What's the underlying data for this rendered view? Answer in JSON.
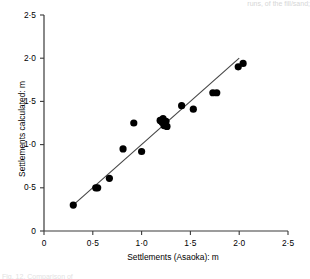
{
  "figure": {
    "clipped_header_text": "runs, of the fill/sand;",
    "clipped_caption_text": "Fig. 12.  Comparison of",
    "background_color": "#ffffff"
  },
  "chart_data": {
    "type": "scatter",
    "title": "",
    "xlabel": "Settlements (Asaoka): m",
    "ylabel": "Settlements calculated: m",
    "xlim": [
      0,
      2.5
    ],
    "ylim": [
      0,
      2.5
    ],
    "xticks": [
      0,
      0.5,
      1.0,
      1.5,
      2.0,
      2.5
    ],
    "yticks": [
      0,
      0.5,
      1.0,
      1.5,
      2.0,
      2.5
    ],
    "xtick_labels": [
      "0",
      "0·5",
      "1·0",
      "1·5",
      "2·0",
      "2·5"
    ],
    "ytick_labels": [
      "0",
      "0·5",
      "1·0",
      "1·5",
      "2·0",
      "2·5"
    ],
    "grid": false,
    "legend": null,
    "marker_color": "#000000",
    "marker_shape": "circle",
    "marker_size_px": 7.2,
    "line_color": "#444444",
    "series": [
      {
        "name": "Calculated vs Asaoka settlements",
        "points": [
          {
            "x": 0.3,
            "y": 0.3
          },
          {
            "x": 0.53,
            "y": 0.5
          },
          {
            "x": 0.55,
            "y": 0.5
          },
          {
            "x": 0.67,
            "y": 0.61
          },
          {
            "x": 0.81,
            "y": 0.95
          },
          {
            "x": 0.92,
            "y": 1.25
          },
          {
            "x": 1.0,
            "y": 0.92
          },
          {
            "x": 1.19,
            "y": 1.28
          },
          {
            "x": 1.21,
            "y": 1.26
          },
          {
            "x": 1.22,
            "y": 1.3
          },
          {
            "x": 1.23,
            "y": 1.22
          },
          {
            "x": 1.25,
            "y": 1.27
          },
          {
            "x": 1.26,
            "y": 1.21
          },
          {
            "x": 1.41,
            "y": 1.45
          },
          {
            "x": 1.53,
            "y": 1.41
          },
          {
            "x": 1.73,
            "y": 1.6
          },
          {
            "x": 1.77,
            "y": 1.6
          },
          {
            "x": 1.99,
            "y": 1.9
          },
          {
            "x": 2.04,
            "y": 1.94
          }
        ]
      }
    ],
    "fit_line": {
      "name": "1:1 trend line",
      "x_start": 0.29,
      "y_start": 0.29,
      "x_end": 2.0,
      "y_end": 2.0
    }
  }
}
